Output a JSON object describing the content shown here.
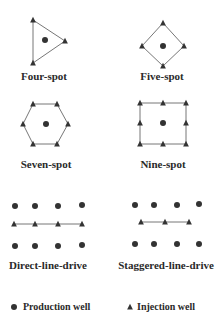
{
  "colors": {
    "well": "#333333",
    "line": "#777777",
    "text": "#2a2a2a"
  },
  "patterns": [
    {
      "id": "four-spot",
      "label": "Four-spot",
      "label_pos": [
        44,
        75
      ],
      "outline": [
        [
          33,
          20
        ],
        [
          65,
          41
        ],
        [
          33,
          63
        ]
      ],
      "closed": true,
      "production_wells": [
        [
          45,
          40
        ]
      ],
      "injection_wells": [
        [
          33,
          20
        ],
        [
          65,
          41
        ],
        [
          33,
          63
        ]
      ]
    },
    {
      "id": "five-spot",
      "label": "Five-spot",
      "label_pos": [
        162,
        75
      ],
      "outline": [
        [
          163,
          23
        ],
        [
          184,
          46
        ],
        [
          163,
          66
        ],
        [
          142,
          46
        ]
      ],
      "closed": true,
      "production_wells": [
        [
          163,
          46
        ]
      ],
      "injection_wells": [
        [
          163,
          23
        ],
        [
          184,
          46
        ],
        [
          163,
          66
        ],
        [
          142,
          46
        ]
      ]
    },
    {
      "id": "seven-spot",
      "label": "Seven-spot",
      "label_pos": [
        46,
        164
      ],
      "outline": [
        [
          33,
          104
        ],
        [
          57,
          104
        ],
        [
          68,
          124
        ],
        [
          57,
          144
        ],
        [
          33,
          144
        ],
        [
          23,
          124
        ]
      ],
      "closed": true,
      "production_wells": [
        [
          46,
          124
        ]
      ],
      "injection_wells": [
        [
          33,
          104
        ],
        [
          57,
          104
        ],
        [
          68,
          124
        ],
        [
          57,
          144
        ],
        [
          33,
          144
        ],
        [
          23,
          124
        ]
      ]
    },
    {
      "id": "nine-spot",
      "label": "Nine-spot",
      "label_pos": [
        163,
        164
      ],
      "outline": [
        [
          140,
          103
        ],
        [
          186,
          103
        ],
        [
          186,
          144
        ],
        [
          140,
          144
        ]
      ],
      "closed": true,
      "production_wells": [
        [
          163,
          123
        ]
      ],
      "injection_wells": [
        [
          140,
          103
        ],
        [
          163,
          103
        ],
        [
          186,
          103
        ],
        [
          140,
          123
        ],
        [
          186,
          123
        ],
        [
          140,
          144
        ],
        [
          163,
          144
        ],
        [
          186,
          144
        ]
      ]
    },
    {
      "id": "direct-line-drive",
      "label": "Direct-line-drive",
      "label_pos": [
        48,
        265
      ],
      "outline": [
        [
          14,
          224
        ],
        [
          82,
          224
        ]
      ],
      "closed": false,
      "production_wells": [
        [
          15,
          206
        ],
        [
          35,
          206
        ],
        [
          58,
          206
        ],
        [
          82,
          205
        ],
        [
          15,
          246
        ],
        [
          35,
          246
        ],
        [
          58,
          246
        ],
        [
          82,
          245
        ]
      ],
      "injection_wells": [
        [
          14,
          224
        ],
        [
          35,
          224
        ],
        [
          58,
          224
        ],
        [
          82,
          224
        ]
      ]
    },
    {
      "id": "staggered-line-drive",
      "label": "Staggered-line-drive",
      "label_pos": [
        166,
        265
      ],
      "outline": [
        [
          141,
          222
        ],
        [
          189,
          222
        ]
      ],
      "closed": false,
      "production_wells": [
        [
          135,
          205
        ],
        [
          154,
          205
        ],
        [
          177,
          205
        ],
        [
          199,
          204
        ],
        [
          135,
          244
        ],
        [
          154,
          244
        ],
        [
          177,
          244
        ],
        [
          199,
          244
        ]
      ],
      "injection_wells": [
        [
          141,
          222
        ],
        [
          165,
          222
        ],
        [
          189,
          222
        ]
      ]
    }
  ],
  "legend": {
    "production": {
      "label": "Production well",
      "icon": "filled-circle",
      "pos": [
        14,
        307
      ]
    },
    "injection": {
      "label": "Injection well",
      "icon": "filled-triangle",
      "pos": [
        130,
        307
      ]
    }
  }
}
